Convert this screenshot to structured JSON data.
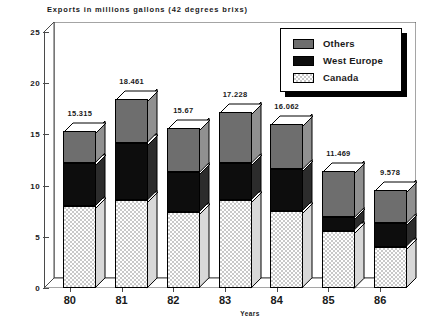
{
  "chart_data": {
    "type": "bar",
    "subtype": "stacked-3d-column",
    "title": "Exports in millions gallons (42 degrees brixs)",
    "xlabel": "Years",
    "ylabel": "",
    "categories": [
      "80",
      "81",
      "82",
      "83",
      "84",
      "85",
      "86"
    ],
    "ylim": [
      0,
      25
    ],
    "yticks": [
      0,
      5,
      10,
      15,
      20,
      25
    ],
    "ytick_labels": [
      "0",
      "5",
      "10",
      "15",
      "20",
      "25"
    ],
    "grid": false,
    "legend_position": "top-right",
    "series": [
      {
        "name": "Canada",
        "values": [
          8.0,
          8.6,
          7.4,
          8.6,
          7.5,
          5.6,
          4.0
        ]
      },
      {
        "name": "West Europe",
        "values": [
          4.2,
          5.6,
          3.9,
          3.6,
          4.1,
          1.3,
          2.3
        ]
      },
      {
        "name": "Others",
        "values": [
          3.115,
          4.261,
          4.37,
          5.028,
          4.462,
          4.569,
          3.278
        ]
      }
    ],
    "totals": [
      15.315,
      18.461,
      15.67,
      17.228,
      16.062,
      11.469,
      9.578
    ],
    "total_labels": [
      "15.315",
      "18.461",
      "15.67",
      "17.228",
      "16.062",
      "11.469",
      "9.578"
    ],
    "colors": {
      "Others": "#6e6e6e",
      "West Europe": "#0d0d0d",
      "Canada": "#c9c9c9",
      "axis": "#4a4a4a",
      "text": "#1a1a1a",
      "background": "#ffffff"
    }
  },
  "legend": {
    "items": [
      {
        "label": "Others",
        "swatch": "others-swatch"
      },
      {
        "label": "West Europe",
        "swatch": "west-europe-swatch"
      },
      {
        "label": "Canada",
        "swatch": "canada-swatch"
      }
    ]
  }
}
